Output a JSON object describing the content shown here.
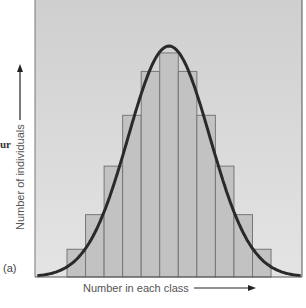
{
  "fragment_text": "ur",
  "panel_label": "(a)",
  "chart_data": {
    "type": "bar",
    "subtype": "histogram-with-normal-curve",
    "title": "",
    "xlabel": "Number in each class",
    "ylabel": "Number of individuals",
    "categories": [
      "1",
      "2",
      "3",
      "4",
      "5",
      "6",
      "7",
      "8",
      "9",
      "10",
      "11"
    ],
    "values": [
      1.2,
      2.7,
      4.8,
      7.0,
      8.9,
      9.7,
      8.9,
      7.0,
      4.8,
      2.7,
      1.2
    ],
    "ylim": [
      0,
      10
    ],
    "xticks_shown": false,
    "yticks_shown": false,
    "grid": false,
    "legend": "none",
    "overlay": {
      "type": "normal-curve",
      "mean": 6,
      "peak": 10.0,
      "sd": 2.2
    },
    "colors": {
      "bar_fill": "#c2c2c2",
      "bar_edge": "#777777",
      "curve": "#2a2a2a",
      "panel_top": "#cfcfcf",
      "panel_bottom": "#e4e4e4"
    }
  }
}
